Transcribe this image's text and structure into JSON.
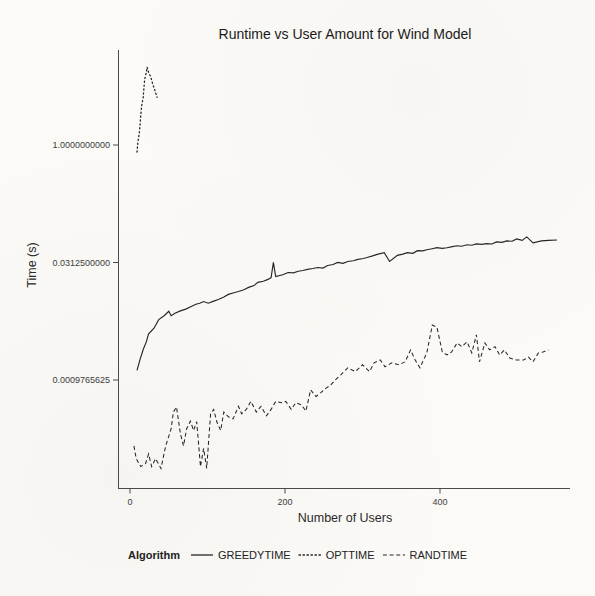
{
  "chart_data": {
    "type": "line",
    "title": "Runtime vs User Amount for Wind Model",
    "xlabel": "Number of Users",
    "ylabel": "Time (s)",
    "x_scale": "linear",
    "y_scale": "log2",
    "grid": "off",
    "legend_position": "bottom",
    "legend_title": "Algorithm",
    "x_ticks": [
      {
        "label": "0",
        "value": 0
      },
      {
        "label": "200",
        "value": 200
      },
      {
        "label": "400",
        "value": 400
      }
    ],
    "y_ticks": [
      {
        "label": "1.0000000000",
        "value": 1.0
      },
      {
        "label": "0.0312500000",
        "value": 0.03125
      },
      {
        "label": "0.0009765625",
        "value": 0.0009765625
      }
    ],
    "x_range_users": [
      0,
      563
    ],
    "y_range_seconds": [
      6e-05,
      12
    ],
    "series": [
      {
        "name": "GREEDYTIME",
        "linestyle": "solid",
        "x": [
          9,
          13,
          17,
          21,
          24,
          31,
          37,
          44,
          50,
          53,
          58,
          65,
          72,
          79,
          85,
          90,
          95,
          101,
          108,
          114,
          121,
          127,
          134,
          140,
          147,
          153,
          160,
          165,
          172,
          178,
          182,
          185,
          188,
          197,
          204,
          211,
          217,
          223,
          229,
          236,
          242,
          249,
          255,
          262,
          268,
          275,
          281,
          288,
          294,
          301,
          306,
          313,
          319,
          328,
          335,
          345,
          352,
          358,
          365,
          371,
          378,
          383,
          390,
          396,
          403,
          409,
          416,
          422,
          428,
          435,
          441,
          447,
          454,
          460,
          467,
          473,
          480,
          486,
          493,
          499,
          506,
          512,
          520,
          531,
          540,
          551
        ],
        "y": [
          0.0013,
          0.0018,
          0.0024,
          0.003,
          0.0038,
          0.0045,
          0.0058,
          0.0065,
          0.0074,
          0.0065,
          0.007,
          0.0075,
          0.0079,
          0.0085,
          0.0091,
          0.0094,
          0.0099,
          0.0094,
          0.01,
          0.0105,
          0.0113,
          0.0122,
          0.0128,
          0.0133,
          0.014,
          0.015,
          0.0158,
          0.0174,
          0.018,
          0.019,
          0.02,
          0.0313,
          0.0207,
          0.0218,
          0.0233,
          0.023,
          0.0241,
          0.0247,
          0.0255,
          0.0262,
          0.027,
          0.0265,
          0.0286,
          0.0295,
          0.0313,
          0.0305,
          0.0322,
          0.033,
          0.0342,
          0.0352,
          0.0362,
          0.038,
          0.0397,
          0.0419,
          0.0322,
          0.0385,
          0.04,
          0.0418,
          0.041,
          0.0443,
          0.044,
          0.0455,
          0.047,
          0.0483,
          0.0475,
          0.0483,
          0.05,
          0.0511,
          0.0505,
          0.0526,
          0.052,
          0.0541,
          0.0535,
          0.0545,
          0.054,
          0.0574,
          0.0565,
          0.0591,
          0.0585,
          0.0627,
          0.06,
          0.0665,
          0.0557,
          0.0591,
          0.06,
          0.0606
        ]
      },
      {
        "name": "OPTTIME",
        "linestyle": "dotted",
        "x": [
          9,
          10,
          12,
          13,
          14,
          15,
          17,
          18,
          19,
          21,
          22,
          24,
          27,
          29,
          32,
          35
        ],
        "y": [
          0.81,
          1.06,
          1.42,
          1.85,
          2.41,
          3.14,
          4.08,
          5.35,
          6.96,
          8.51,
          9.92,
          8.51,
          7.36,
          6.19,
          5.03,
          4.08
        ]
      },
      {
        "name": "RANDTIME",
        "linestyle": "dashed",
        "x": [
          5,
          8,
          14,
          20,
          24,
          28,
          33,
          40,
          46,
          53,
          56,
          60,
          65,
          69,
          73,
          78,
          82,
          86,
          91,
          95,
          99,
          104,
          108,
          112,
          117,
          121,
          127,
          133,
          140,
          144,
          150,
          156,
          163,
          169,
          176,
          182,
          188,
          195,
          201,
          208,
          214,
          221,
          227,
          233,
          240,
          246,
          253,
          259,
          265,
          272,
          281,
          291,
          300,
          309,
          315,
          323,
          329,
          338,
          347,
          355,
          362,
          368,
          374,
          383,
          390,
          396,
          403,
          409,
          415,
          422,
          428,
          435,
          441,
          447,
          451,
          458,
          464,
          471,
          477,
          483,
          490,
          499,
          508,
          514,
          520,
          527,
          533,
          540
        ],
        "y": [
          0.00014,
          9.6e-05,
          7.6e-05,
          8.3e-05,
          0.00011,
          7.6e-05,
          9.6e-05,
          7.2e-05,
          0.00014,
          0.00023,
          0.00038,
          0.00044,
          0.0002,
          0.00014,
          0.00023,
          0.00029,
          0.00022,
          0.000285,
          7.6e-05,
          0.00013,
          7.2e-05,
          0.00036,
          0.00041,
          0.000285,
          0.00022,
          0.00038,
          0.00033,
          0.00031,
          0.00045,
          0.00036,
          0.00041,
          0.00052,
          0.00038,
          0.00045,
          0.00034,
          0.00041,
          0.00052,
          0.0005,
          0.00052,
          0.00041,
          0.0005,
          0.00047,
          0.00039,
          0.00073,
          0.0006,
          0.00067,
          0.00077,
          0.00084,
          0.00098,
          0.00114,
          0.0014,
          0.00125,
          0.00153,
          0.00125,
          0.00162,
          0.00176,
          0.00144,
          0.00162,
          0.00153,
          0.00167,
          0.00237,
          0.00176,
          0.0014,
          0.00217,
          0.00493,
          0.00465,
          0.00223,
          0.00204,
          0.00223,
          0.00292,
          0.00261,
          0.003,
          0.00217,
          0.0037,
          0.00167,
          0.00292,
          0.00237,
          0.00261,
          0.00204,
          0.00237,
          0.00187,
          0.00176,
          0.00176,
          0.00192,
          0.00167,
          0.00217,
          0.00223,
          0.00237
        ]
      }
    ]
  }
}
